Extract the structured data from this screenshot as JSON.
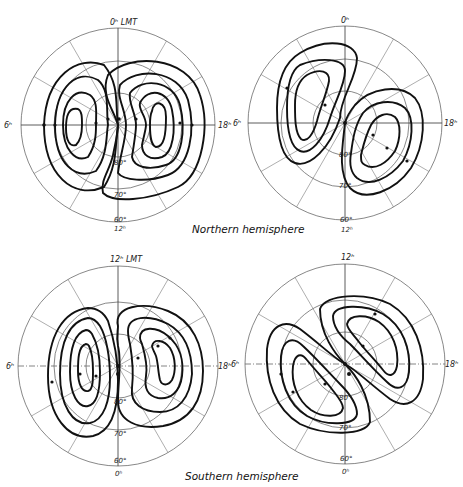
{
  "figure": {
    "captions": {
      "northern": "Northern hemisphere",
      "southern": "Southern hemisphere"
    },
    "panels": [
      {
        "id": "north-left",
        "hemisphere": "Northern",
        "top_label": "0ʰ LMT",
        "bottom_label": "12ʰ",
        "left_label": "6ʰ",
        "right_label": "18ʰ",
        "lat_labels": [
          "80°",
          "70°",
          "60°"
        ],
        "pattern": "two-cell (dusk cell larger)"
      },
      {
        "id": "north-right",
        "hemisphere": "Northern",
        "top_label": "0ʰ",
        "bottom_label": "12ʰ",
        "left_label": "6ʰ",
        "right_label": "18ʰ",
        "lat_labels": [
          "80°",
          "70°",
          "60°"
        ],
        "pattern": "two-cell rotated"
      },
      {
        "id": "south-left",
        "hemisphere": "Southern",
        "top_label": "12ʰ LMT",
        "bottom_label": "0ʰ",
        "left_label": "6ʰ",
        "right_label": "18ʰ",
        "lat_labels": [
          "80°",
          "70°",
          "60°"
        ],
        "pattern": "two-cell"
      },
      {
        "id": "south-right",
        "hemisphere": "Southern",
        "top_label": "12ʰ",
        "bottom_label": "0ʰ",
        "left_label": "6ʰ",
        "right_label": "18ʰ",
        "lat_labels": [
          "80°",
          "70°",
          "60°"
        ],
        "pattern": "two-cell S-shaped"
      }
    ]
  }
}
